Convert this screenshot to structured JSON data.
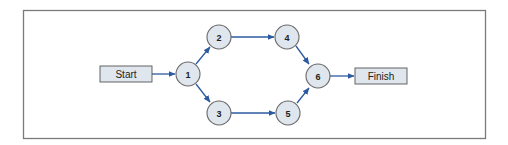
{
  "diagram": {
    "type": "network-flow",
    "colors": {
      "node_fill": "#dfe6ee",
      "edge": "#2b5aa0",
      "frame": "#7a7a7a"
    },
    "terminals": {
      "start": {
        "label": "Start"
      },
      "finish": {
        "label": "Finish"
      }
    },
    "nodes": [
      {
        "id": "1",
        "label": "1"
      },
      {
        "id": "2",
        "label": "2"
      },
      {
        "id": "3",
        "label": "3"
      },
      {
        "id": "4",
        "label": "4"
      },
      {
        "id": "5",
        "label": "5"
      },
      {
        "id": "6",
        "label": "6"
      }
    ],
    "edges": [
      {
        "from": "Start",
        "to": "1"
      },
      {
        "from": "1",
        "to": "2"
      },
      {
        "from": "1",
        "to": "3"
      },
      {
        "from": "2",
        "to": "4"
      },
      {
        "from": "3",
        "to": "5"
      },
      {
        "from": "4",
        "to": "6"
      },
      {
        "from": "5",
        "to": "6"
      },
      {
        "from": "6",
        "to": "Finish"
      }
    ]
  }
}
